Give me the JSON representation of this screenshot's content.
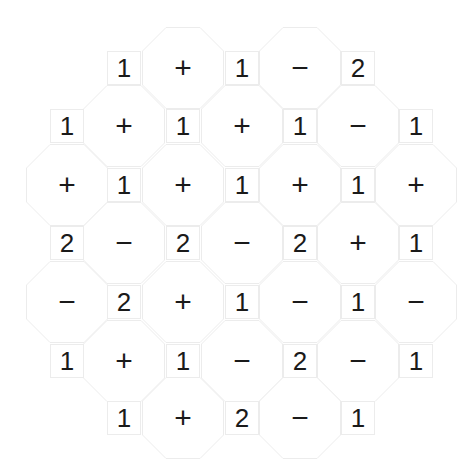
{
  "puzzle": {
    "grid": [
      [
        "",
        "1",
        "+",
        "1",
        "−",
        "2",
        ""
      ],
      [
        "1",
        "+",
        "1",
        "+",
        "1",
        "−",
        "1"
      ],
      [
        "+",
        "1",
        "+",
        "1",
        "+",
        "1",
        "+"
      ],
      [
        "2",
        "−",
        "2",
        "−",
        "2",
        "+",
        "1"
      ],
      [
        "−",
        "2",
        "+",
        "1",
        "−",
        "1",
        "−"
      ],
      [
        "1",
        "+",
        "1",
        "−",
        "2",
        "−",
        "1"
      ],
      [
        "",
        "1",
        "+",
        "2",
        "−",
        "1",
        ""
      ]
    ],
    "col_x": [
      67,
      124,
      183,
      242,
      300,
      358,
      416
    ],
    "row_y": [
      68,
      126,
      185,
      243,
      302,
      361,
      418
    ],
    "colors": {
      "text": "#1a1a1a",
      "outline": "#ececec",
      "background": "#ffffff"
    }
  }
}
